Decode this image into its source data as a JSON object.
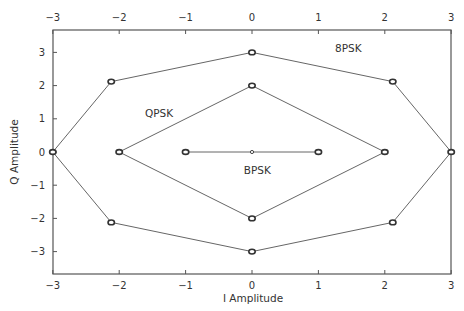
{
  "chart_data": {
    "type": "scatter",
    "title": "",
    "xlabel": "I Amplitude",
    "ylabel": "Q Amplitude",
    "xlim": [
      -3,
      3
    ],
    "ylim": [
      -3.6,
      3.6
    ],
    "grid": false,
    "legend": "none (inline labels)",
    "x_ticks": [
      -3,
      -2,
      -1,
      0,
      1,
      2,
      3
    ],
    "y_ticks": [
      -3,
      -2,
      -1,
      0,
      1,
      2,
      3
    ],
    "top_x_ticks": [
      -3,
      -2,
      -1,
      0,
      1,
      2,
      3
    ],
    "series": [
      {
        "name": "8PSK",
        "label_pos": [
          1.45,
          3.0
        ],
        "connected": true,
        "points": [
          [
            0,
            3
          ],
          [
            2.12,
            2.12
          ],
          [
            3,
            0
          ],
          [
            2.12,
            -2.12
          ],
          [
            0,
            -3
          ],
          [
            -2.12,
            -2.12
          ],
          [
            -3,
            0
          ],
          [
            -2.12,
            2.12
          ]
        ]
      },
      {
        "name": "QPSK",
        "label_pos": [
          -1.4,
          1.05
        ],
        "connected": true,
        "points": [
          [
            0,
            2
          ],
          [
            2,
            0
          ],
          [
            0,
            -2
          ],
          [
            -2,
            0
          ]
        ]
      },
      {
        "name": "BPSK",
        "label_pos": [
          0.08,
          -0.65
        ],
        "connected": true,
        "points": [
          [
            -1,
            0
          ],
          [
            1,
            0
          ]
        ]
      }
    ],
    "origin_marker": [
      0,
      0
    ]
  },
  "colors": {
    "axis": "#555555",
    "line": "#666666",
    "marker": "#333333",
    "text": "#333333"
  }
}
